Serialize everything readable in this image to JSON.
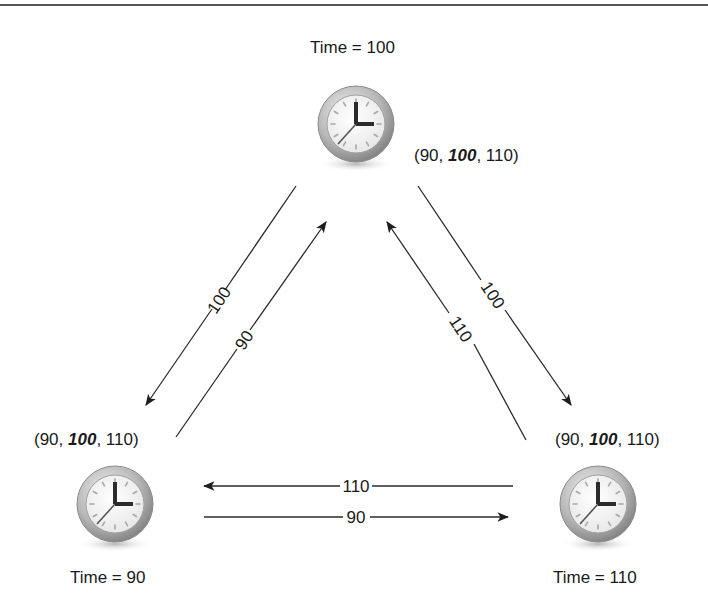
{
  "diagram": {
    "nodes": [
      {
        "id": "top",
        "time_label": "Time = 100",
        "vector_prefix": "(90, ",
        "vector_bold": "100",
        "vector_suffix": ", 110)"
      },
      {
        "id": "left",
        "time_label": "Time = 90",
        "vector_prefix": "(90, ",
        "vector_bold": "100",
        "vector_suffix": ", 110)"
      },
      {
        "id": "right",
        "time_label": "Time = 110",
        "vector_prefix": "(90, ",
        "vector_bold": "100",
        "vector_suffix": ", 110)"
      }
    ],
    "edges": [
      {
        "from": "top",
        "to": "left",
        "label": "100"
      },
      {
        "from": "left",
        "to": "top",
        "label": "90"
      },
      {
        "from": "top",
        "to": "right",
        "label": "100"
      },
      {
        "from": "right",
        "to": "top",
        "label": "110"
      },
      {
        "from": "right",
        "to": "left",
        "label": "110"
      },
      {
        "from": "left",
        "to": "right",
        "label": "90"
      }
    ],
    "icon": "clock-icon",
    "colors": {
      "line": "#2a2a2a",
      "clock_rim": "#9a9a9a",
      "clock_face": "#f7f7f7",
      "hands": "#2b2b2b"
    }
  }
}
